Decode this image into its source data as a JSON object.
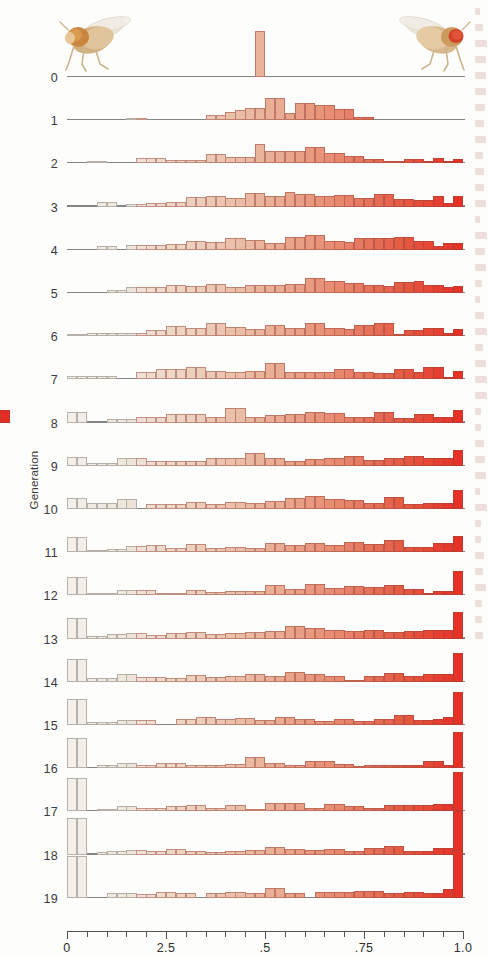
{
  "axes": {
    "y_title": "Generation",
    "x_title_prefix": "Frequency of ",
    "x_title_italic": "bw",
    "x_title_sup": "75",
    "x_title_suffix": " allele",
    "x_ticks_labeled": [
      "0",
      "2.5",
      ".5",
      ".75",
      "1.0"
    ],
    "x_tick_values": [
      0,
      0.25,
      0.5,
      0.75,
      1.0
    ],
    "x_minor_count": 20,
    "x_range": [
      0,
      1.0
    ],
    "generations": [
      "0",
      "1",
      "2",
      "3",
      "4",
      "5",
      "6",
      "7",
      "8",
      "9",
      "10",
      "11",
      "12",
      "13",
      "14",
      "15",
      "16",
      "17",
      "18",
      "19"
    ]
  },
  "legend_images": {
    "left_fly": "fly-light-eye-icon",
    "right_fly": "fly-red-eye-icon"
  },
  "colors": {
    "bar_low": "#efeae4",
    "bar_mid": "#e8a58c",
    "bar_high": "#e8332a",
    "baseline": "#6f6f6f",
    "axis": "#555555",
    "text": "#2f2f2f"
  },
  "chart_data": {
    "type": "bar",
    "title": "",
    "xlabel": "Frequency of bw75 allele",
    "ylabel": "Generation",
    "xlim": [
      0,
      1.0
    ],
    "grid": false,
    "legend_position": "top",
    "bin_width": 0.025,
    "bin_centers": [
      0.0125,
      0.0375,
      0.0625,
      0.0875,
      0.1125,
      0.1375,
      0.1625,
      0.1875,
      0.2125,
      0.2375,
      0.2625,
      0.2875,
      0.3125,
      0.3375,
      0.3625,
      0.3875,
      0.4125,
      0.4375,
      0.4625,
      0.4875,
      0.5125,
      0.5375,
      0.5625,
      0.5875,
      0.6125,
      0.6375,
      0.6625,
      0.6875,
      0.7125,
      0.7375,
      0.7625,
      0.7875,
      0.8125,
      0.8375,
      0.8625,
      0.8875,
      0.9125,
      0.9375,
      0.9625,
      0.9875
    ],
    "series": [
      {
        "name": "0",
        "values": [
          0,
          0,
          0,
          0,
          0,
          0,
          0,
          0,
          0,
          0,
          0,
          0,
          0,
          0,
          0,
          0,
          0,
          0,
          0,
          50,
          0,
          0,
          0,
          0,
          0,
          0,
          0,
          0,
          0,
          0,
          0,
          0,
          0,
          0,
          0,
          0,
          0,
          0,
          0,
          0
        ]
      },
      {
        "name": "1",
        "values": [
          0,
          0,
          0,
          0,
          0,
          0,
          2,
          2,
          0,
          0,
          0,
          0,
          0,
          0,
          6,
          6,
          9,
          11,
          13,
          13,
          24,
          24,
          8,
          19,
          19,
          17,
          17,
          12,
          12,
          3,
          3,
          0,
          0,
          0,
          0,
          0,
          0,
          0,
          0,
          0
        ]
      },
      {
        "name": "2",
        "values": [
          0,
          0,
          3,
          3,
          0,
          0,
          0,
          6,
          6,
          6,
          4,
          4,
          4,
          4,
          10,
          10,
          7,
          7,
          7,
          21,
          14,
          14,
          14,
          14,
          18,
          18,
          11,
          11,
          8,
          8,
          5,
          5,
          3,
          3,
          5,
          5,
          2,
          6,
          2,
          5
        ]
      },
      {
        "name": "3",
        "values": [
          0,
          0,
          0,
          5,
          5,
          0,
          3,
          3,
          4,
          4,
          5,
          5,
          10,
          10,
          11,
          11,
          9,
          9,
          15,
          15,
          12,
          12,
          16,
          14,
          14,
          11,
          11,
          13,
          13,
          9,
          9,
          14,
          14,
          8,
          8,
          7,
          7,
          11,
          4,
          12
        ]
      },
      {
        "name": "4",
        "values": [
          0,
          0,
          0,
          4,
          4,
          0,
          5,
          5,
          5,
          5,
          6,
          6,
          10,
          10,
          9,
          9,
          13,
          13,
          11,
          11,
          7,
          7,
          14,
          14,
          16,
          16,
          10,
          10,
          8,
          13,
          13,
          13,
          13,
          14,
          14,
          10,
          10,
          4,
          7,
          7
        ]
      },
      {
        "name": "5",
        "values": [
          0,
          0,
          0,
          0,
          3,
          3,
          6,
          6,
          7,
          7,
          9,
          9,
          8,
          8,
          10,
          10,
          6,
          6,
          9,
          9,
          9,
          9,
          10,
          10,
          16,
          16,
          13,
          13,
          11,
          11,
          9,
          9,
          8,
          12,
          12,
          13,
          9,
          9,
          6,
          8
        ]
      },
      {
        "name": "6",
        "values": [
          2,
          2,
          3,
          3,
          4,
          4,
          4,
          4,
          7,
          7,
          11,
          11,
          9,
          9,
          14,
          14,
          10,
          10,
          8,
          8,
          12,
          12,
          9,
          9,
          14,
          14,
          9,
          9,
          8,
          12,
          12,
          14,
          14,
          2,
          7,
          7,
          9,
          9,
          3,
          8
        ]
      },
      {
        "name": "7",
        "values": [
          4,
          4,
          4,
          4,
          4,
          0,
          0,
          8,
          8,
          11,
          11,
          11,
          14,
          14,
          9,
          9,
          8,
          8,
          9,
          9,
          18,
          18,
          8,
          8,
          8,
          8,
          8,
          11,
          11,
          8,
          8,
          7,
          7,
          11,
          11,
          8,
          14,
          14,
          2,
          9
        ]
      },
      {
        "name": "8",
        "values": [
          11,
          11,
          0,
          0,
          4,
          4,
          4,
          6,
          6,
          6,
          9,
          9,
          9,
          9,
          6,
          6,
          16,
          16,
          6,
          6,
          8,
          8,
          9,
          9,
          12,
          12,
          10,
          10,
          6,
          6,
          6,
          11,
          11,
          5,
          5,
          9,
          9,
          6,
          6,
          14,
          14
        ]
      },
      {
        "name": "9",
        "values": [
          10,
          10,
          3,
          3,
          3,
          9,
          9,
          9,
          5,
          5,
          5,
          5,
          5,
          5,
          9,
          9,
          9,
          9,
          14,
          14,
          9,
          9,
          5,
          5,
          7,
          7,
          9,
          9,
          11,
          11,
          6,
          6,
          9,
          9,
          11,
          11,
          9,
          9,
          9,
          17
        ]
      },
      {
        "name": "10",
        "values": [
          12,
          12,
          6,
          6,
          6,
          11,
          11,
          0,
          5,
          5,
          5,
          5,
          8,
          8,
          5,
          5,
          8,
          8,
          7,
          7,
          9,
          9,
          12,
          12,
          14,
          14,
          11,
          11,
          10,
          10,
          6,
          6,
          13,
          13,
          5,
          5,
          7,
          7,
          7,
          21
        ]
      },
      {
        "name": "11",
        "values": [
          17,
          17,
          2,
          2,
          4,
          4,
          7,
          7,
          8,
          8,
          5,
          5,
          9,
          9,
          5,
          5,
          6,
          6,
          5,
          5,
          10,
          10,
          8,
          8,
          10,
          10,
          8,
          8,
          11,
          11,
          9,
          9,
          13,
          13,
          6,
          6,
          6,
          10,
          10,
          18
        ]
      },
      {
        "name": "12",
        "values": [
          20,
          20,
          2,
          2,
          2,
          6,
          6,
          6,
          6,
          3,
          3,
          3,
          6,
          6,
          4,
          4,
          5,
          5,
          5,
          5,
          11,
          11,
          7,
          7,
          12,
          12,
          8,
          8,
          10,
          10,
          9,
          9,
          11,
          11,
          7,
          7,
          2,
          5,
          5,
          27
        ]
      },
      {
        "name": "13",
        "values": [
          22,
          22,
          3,
          3,
          5,
          5,
          6,
          6,
          4,
          4,
          6,
          6,
          7,
          7,
          5,
          5,
          6,
          6,
          7,
          7,
          8,
          8,
          14,
          14,
          11,
          11,
          9,
          9,
          8,
          8,
          9,
          9,
          7,
          7,
          8,
          8,
          9,
          9,
          9,
          29
        ]
      },
      {
        "name": "14",
        "values": [
          25,
          25,
          4,
          4,
          4,
          8,
          8,
          5,
          5,
          5,
          4,
          4,
          7,
          7,
          5,
          5,
          6,
          6,
          8,
          8,
          6,
          6,
          11,
          11,
          9,
          9,
          6,
          6,
          2,
          2,
          6,
          6,
          10,
          10,
          6,
          6,
          8,
          8,
          8,
          31
        ]
      },
      {
        "name": "15",
        "values": [
          28,
          28,
          3,
          3,
          3,
          5,
          5,
          5,
          5,
          0,
          0,
          6,
          6,
          9,
          9,
          6,
          6,
          8,
          8,
          5,
          5,
          9,
          9,
          7,
          7,
          4,
          4,
          6,
          6,
          4,
          4,
          6,
          6,
          11,
          11,
          5,
          5,
          6,
          9,
          36
        ]
      },
      {
        "name": "16",
        "values": [
          33,
          33,
          0,
          4,
          4,
          6,
          6,
          4,
          4,
          6,
          6,
          6,
          3,
          3,
          4,
          4,
          5,
          5,
          12,
          12,
          6,
          6,
          4,
          4,
          8,
          8,
          8,
          5,
          5,
          2,
          3,
          3,
          4,
          4,
          4,
          4,
          8,
          8,
          4,
          39
        ]
      },
      {
        "name": "17",
        "values": [
          36,
          36,
          0,
          3,
          3,
          6,
          6,
          4,
          4,
          4,
          6,
          6,
          7,
          7,
          4,
          4,
          7,
          7,
          3,
          3,
          9,
          9,
          9,
          9,
          4,
          4,
          8,
          8,
          6,
          6,
          4,
          4,
          7,
          7,
          7,
          7,
          7,
          8,
          8,
          43
        ]
      },
      {
        "name": "18",
        "values": [
          40,
          40,
          0,
          3,
          4,
          4,
          5,
          5,
          4,
          4,
          6,
          6,
          4,
          4,
          3,
          3,
          4,
          4,
          5,
          5,
          8,
          8,
          6,
          6,
          5,
          5,
          6,
          6,
          4,
          4,
          7,
          7,
          9,
          9,
          4,
          4,
          4,
          7,
          7,
          47
        ]
      },
      {
        "name": "19",
        "values": [
          45,
          45,
          0,
          0,
          5,
          5,
          5,
          4,
          4,
          6,
          6,
          5,
          5,
          0,
          5,
          5,
          6,
          6,
          5,
          5,
          11,
          11,
          5,
          5,
          0,
          6,
          6,
          6,
          6,
          7,
          7,
          7,
          5,
          5,
          6,
          6,
          5,
          5,
          10,
          52
        ]
      }
    ]
  }
}
